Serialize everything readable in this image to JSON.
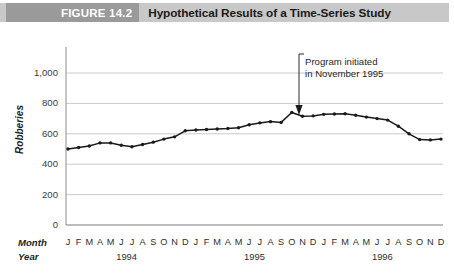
{
  "header": {
    "figure_number": "FIGURE 14.2",
    "title": "Hypothetical Results of a Time-Series Study"
  },
  "chart_data": {
    "type": "line",
    "title": "Hypothetical Results of a Time-Series Study",
    "xlabel": "Month",
    "ylabel": "Robberies",
    "ylim": [
      0,
      1100
    ],
    "yticks": [
      0,
      200,
      400,
      600,
      800,
      1000
    ],
    "ytick_labels": [
      "0",
      "200",
      "400",
      "600",
      "800",
      "1,000"
    ],
    "grid": true,
    "legend": null,
    "row_labels": {
      "month": "Month",
      "year": "Year"
    },
    "months": [
      "J",
      "F",
      "M",
      "A",
      "M",
      "J",
      "J",
      "A",
      "S",
      "O",
      "N",
      "D"
    ],
    "years": [
      "1994",
      "1995",
      "1996"
    ],
    "categories": [
      "J 1994",
      "F 1994",
      "M 1994",
      "A 1994",
      "M 1994",
      "J 1994",
      "J 1994",
      "A 1994",
      "S 1994",
      "O 1994",
      "N 1994",
      "D 1994",
      "J 1995",
      "F 1995",
      "M 1995",
      "A 1995",
      "M 1995",
      "J 1995",
      "J 1995",
      "A 1995",
      "S 1995",
      "O 1995",
      "N 1995",
      "D 1995",
      "J 1996",
      "F 1996",
      "M 1996",
      "A 1996",
      "M 1996",
      "J 1996",
      "J 1996",
      "A 1996",
      "S 1996",
      "O 1996",
      "N 1996",
      "D 1996"
    ],
    "values": [
      500,
      510,
      520,
      540,
      540,
      525,
      515,
      530,
      545,
      565,
      580,
      620,
      625,
      628,
      632,
      635,
      640,
      660,
      672,
      680,
      675,
      740,
      715,
      718,
      728,
      730,
      732,
      722,
      710,
      700,
      690,
      650,
      600,
      562,
      560,
      565
    ],
    "annotation": {
      "line1": "Program initiated",
      "line2": "in November 1995",
      "target_category": "N 1995"
    },
    "series_color": "#1a1a1a",
    "grid_color": "#c4c4c4",
    "axis_color": "#8d8d8d"
  }
}
